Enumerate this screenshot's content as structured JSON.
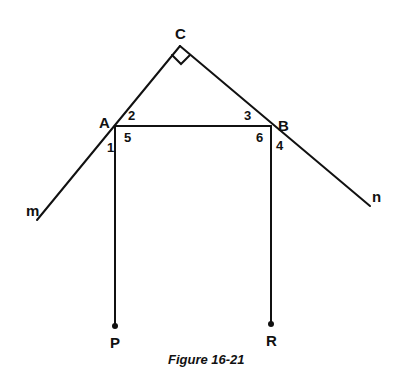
{
  "diagram": {
    "caption": "Figure 16-21",
    "points": {
      "C": "C",
      "A": "A",
      "B": "B",
      "P": "P",
      "R": "R"
    },
    "lines": {
      "m": "m",
      "n": "n"
    },
    "angles": [
      "1",
      "2",
      "3",
      "4",
      "5",
      "6"
    ],
    "right_angle_at": "C",
    "segments": [
      "CA",
      "CB",
      "AB",
      "AP",
      "BR",
      "Am",
      "Bn"
    ]
  }
}
